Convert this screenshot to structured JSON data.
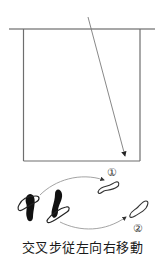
{
  "diagram": {
    "caption": "交叉步従左向右移動",
    "markers": [
      {
        "label": "①",
        "x": 112,
        "y": 176
      },
      {
        "label": "②",
        "x": 138,
        "y": 232
      }
    ],
    "colors": {
      "line": "#8a8a8a",
      "box": "#6e6e6e",
      "footprint_fill": "#111111",
      "footprint_outline": "#333333",
      "arrow": "#7a7a7a"
    },
    "icons": {
      "left_foot_filled": "footprint-icon",
      "right_foot_filled": "footprint-icon",
      "target_foot_1": "footprint-outline-icon",
      "target_foot_2": "footprint-outline-icon"
    }
  }
}
